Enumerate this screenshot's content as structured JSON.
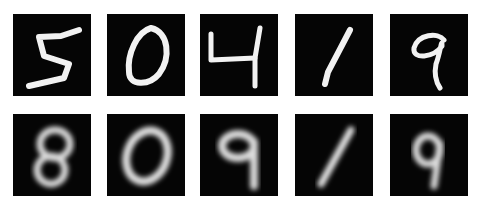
{
  "figure": {
    "rows": [
      {
        "name": "original",
        "digits": [
          "5",
          "0",
          "4",
          "1",
          "9"
        ],
        "style": "sharp"
      },
      {
        "name": "reconstruction",
        "digits": [
          "8",
          "0",
          "9",
          "1",
          "9"
        ],
        "style": "blurred"
      }
    ],
    "colors": {
      "background": "#ffffff",
      "tile": "#050505",
      "stroke": "#f2f2f2"
    }
  }
}
